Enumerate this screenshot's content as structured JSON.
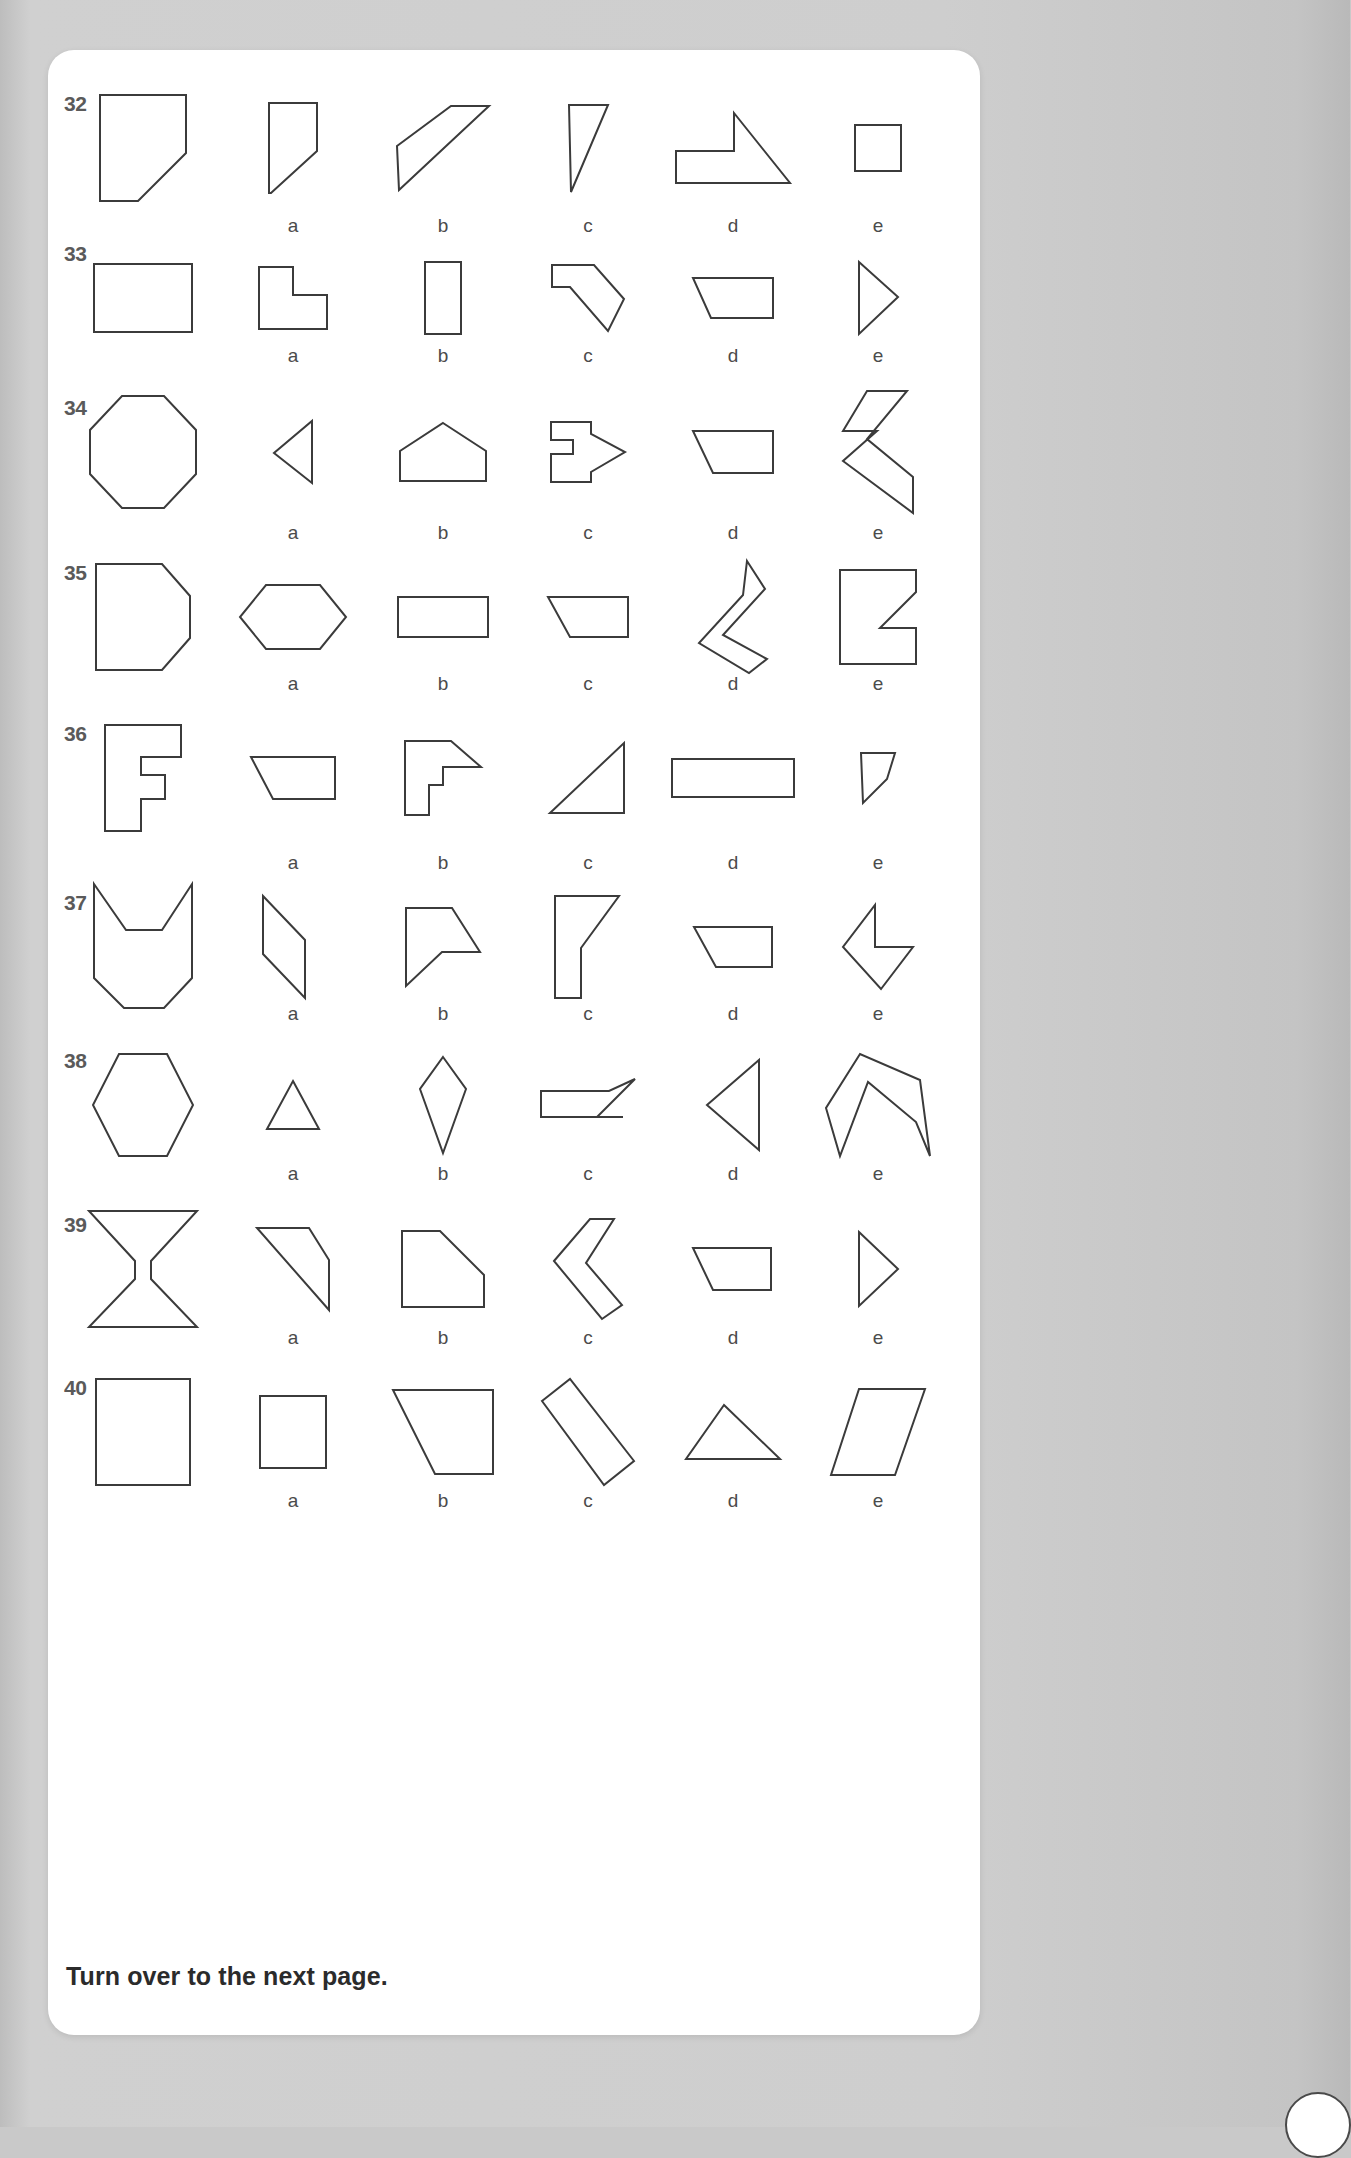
{
  "page": {
    "footer_note": "Turn over to the next page.",
    "background_color": "#c9c9c9",
    "sheet_color": "#ffffff",
    "stroke_color": "#3b3b3b",
    "number_color": "#5a5a5a",
    "label_color": "#4b4b4b"
  },
  "option_labels": [
    "a",
    "b",
    "c",
    "d",
    "e"
  ],
  "rows": [
    {
      "number": "32",
      "target": {
        "name": "rectangle-with-cut-bottom-right-corner",
        "viewbox": "0 0 90 110",
        "points": "2,2 88,2 88,60 40,108 2,108"
      },
      "options": [
        {
          "label": "a",
          "name": "small-rectangle-with-cut-corner",
          "viewbox": "0 0 52 94",
          "points": "2,2 50,2 50,50 4,92 2,92 2,2"
        },
        {
          "label": "b",
          "name": "wide-diagonal-parallelogram",
          "viewbox": "0 0 96 88",
          "points": "2,42 56,2 94,2 4,86"
        },
        {
          "label": "c",
          "name": "narrow-right-triangle",
          "viewbox": "0 0 44 92",
          "points": "3,3 42,3 5,90"
        },
        {
          "label": "d",
          "name": "notched-arrow-polygon",
          "viewbox": "0 0 118 74",
          "points": "2,40 2,72 116,72 60,2 60,40"
        },
        {
          "label": "e",
          "name": "small-square",
          "viewbox": "0 0 50 50",
          "points": "2,2 48,2 48,48 2,48"
        }
      ]
    },
    {
      "number": "33",
      "target": {
        "name": "wide-rectangle",
        "viewbox": "0 0 102 72",
        "points": "2,2 100,2 100,70 2,70"
      },
      "options": [
        {
          "label": "a",
          "name": "l-shape-with-bevel",
          "viewbox": "0 0 72 66",
          "points": "2,2 2,64 70,64 70,30 36,30 36,2"
        },
        {
          "label": "b",
          "name": "tall-narrow-rectangle",
          "viewbox": "0 0 40 76",
          "points": "2,2 38,2 38,74 2,74"
        },
        {
          "label": "c",
          "name": "hook-shape-with-diagonal",
          "viewbox": "0 0 76 70",
          "points": "2,2 44,2 74,36 58,68 20,24 2,24"
        },
        {
          "label": "d",
          "name": "trapezoid-flat-top",
          "viewbox": "0 0 84 44",
          "points": "2,2 82,2 82,42 20,42"
        },
        {
          "label": "e",
          "name": "right-pointing-triangle",
          "viewbox": "0 0 44 78",
          "points": "3,3 42,38 3,75"
        }
      ]
    },
    {
      "number": "34",
      "target": {
        "name": "regular-octagon",
        "viewbox": "0 0 110 116",
        "points": "34,2 76,2 108,36 108,80 76,114 34,114 2,80 2,36"
      },
      "options": [
        {
          "label": "a",
          "name": "left-pointing-triangle",
          "viewbox": "0 0 42 66",
          "points": "40,2 40,64 2,34"
        },
        {
          "label": "b",
          "name": "house-pentagon",
          "viewbox": "0 0 90 62",
          "points": "45,2 88,30 88,60 2,60 2,30"
        },
        {
          "label": "c",
          "name": "arrow-block-right",
          "viewbox": "0 0 78 64",
          "points": "2,2 42,2 42,14 76,32 42,52 42,62 2,62 2,34 24,34 24,20 2,20"
        },
        {
          "label": "d",
          "name": "trapezoid-angled-left",
          "viewbox": "0 0 84 46",
          "points": "2,2 82,2 82,44 22,44"
        },
        {
          "label": "e",
          "name": "thick-angled-band",
          "viewbox": "0 0 74 126",
          "points": "26,2 66,2 26,50 72,88 72,124 2,72 36,42 2,42"
        }
      ]
    },
    {
      "number": "35",
      "target": {
        "name": "rectangle-with-two-cut-corners",
        "viewbox": "0 0 98 110",
        "points": "2,2 68,2 96,34 96,76 68,108 2,108"
      },
      "options": [
        {
          "label": "a",
          "name": "elongated-hexagon",
          "viewbox": "0 0 110 68",
          "points": "28,2 82,2 108,34 82,66 28,66 2,34"
        },
        {
          "label": "b",
          "name": "small-wide-rectangle",
          "viewbox": "0 0 94 44",
          "points": "2,2 92,2 92,42 2,42"
        },
        {
          "label": "c",
          "name": "trapezoid-right-angle",
          "viewbox": "0 0 84 44",
          "points": "2,2 82,2 82,42 24,42"
        },
        {
          "label": "d",
          "name": "chevron-curve-shape",
          "viewbox": "0 0 72 116",
          "points": "50,2 68,30 26,76 70,100 52,114 2,84 46,36"
        },
        {
          "label": "e",
          "name": "flag-notch-shape",
          "viewbox": "0 0 80 98",
          "points": "2,2 78,2 78,24 42,60 78,60 78,96 2,96 2,2"
        }
      ]
    },
    {
      "number": "36",
      "target": {
        "name": "c-shaped-block",
        "viewbox": "0 0 80 110",
        "points": "2,2 78,2 78,34 38,34 38,52 62,52 62,76 38,76 38,108 2,108"
      },
      "options": [
        {
          "label": "a",
          "name": "trapezoid-slanted-left",
          "viewbox": "0 0 88 46",
          "points": "2,2 86,2 86,44 24,44"
        },
        {
          "label": "b",
          "name": "hook-block-shape",
          "viewbox": "0 0 80 78",
          "points": "2,2 48,2 78,28 40,28 40,46 26,46 26,76 2,76"
        },
        {
          "label": "c",
          "name": "right-triangle-pointing-up",
          "viewbox": "0 0 80 74",
          "points": "76,2 76,72 2,72"
        },
        {
          "label": "d",
          "name": "long-flat-rectangle",
          "viewbox": "0 0 126 42",
          "points": "2,2 124,2 124,40 2,40"
        },
        {
          "label": "e",
          "name": "small-slanted-quad",
          "viewbox": "0 0 38 54",
          "points": "2,2 36,2 28,28 4,52 2,2"
        }
      ]
    },
    {
      "number": "37",
      "target": {
        "name": "cat-head-notched-polygon",
        "viewbox": "0 0 102 130",
        "points": "2,2 34,48 70,48 100,2 100,96 72,126 32,126 2,96"
      },
      "options": [
        {
          "label": "a",
          "name": "slanted-parallelogram",
          "viewbox": "0 0 64 106",
          "points": "2,2 44,46 44,104 2,60"
        },
        {
          "label": "b",
          "name": "arrow-flag-shape",
          "viewbox": "0 0 78 82",
          "points": "2,2 48,2 76,46 38,46 2,80"
        },
        {
          "label": "c",
          "name": "boot-shape-polygon",
          "viewbox": "0 0 70 106",
          "points": "2,2 66,2 28,54 28,104 2,104"
        },
        {
          "label": "d",
          "name": "trapezoid-sloped-left",
          "viewbox": "0 0 82 44",
          "points": "2,2 80,2 80,42 24,42"
        },
        {
          "label": "e",
          "name": "arrow-chevron-left",
          "viewbox": "0 0 74 88",
          "points": "34,2 34,44 72,44 40,86 2,44"
        }
      ]
    },
    {
      "number": "38",
      "target": {
        "name": "regular-hexagon",
        "viewbox": "0 0 104 106",
        "points": "28,2 76,2 102,53 76,104 28,104 2,53"
      },
      "options": [
        {
          "label": "a",
          "name": "small-triangle",
          "viewbox": "0 0 56 52",
          "points": "28,2 54,50 2,50"
        },
        {
          "label": "b",
          "name": "narrow-kite-diamond",
          "viewbox": "0 0 50 100",
          "points": "25,2 48,34 25,98 2,34"
        },
        {
          "label": "c",
          "name": "boat-shape-polygon",
          "viewbox": "0 0 98 56",
          "points": "2,14 70,14 96,2 58,40 84,40 2,40 2,14"
        },
        {
          "label": "d",
          "name": "left-pointing-triangle-large",
          "viewbox": "0 0 56 94",
          "points": "54,2 54,92 2,47"
        },
        {
          "label": "e",
          "name": "bent-band-polygon",
          "viewbox": "0 0 108 106",
          "points": "36,2 2,56 16,104 44,30 92,70 106,104 96,28"
        }
      ]
    },
    {
      "number": "39",
      "target": {
        "name": "hourglass-i-beam-shape",
        "viewbox": "0 0 112 120",
        "points": "2,2 110,2 64,52 64,70 110,118 2,118 48,70 48,52"
      },
      "options": [
        {
          "label": "a",
          "name": "triangle-with-notch",
          "viewbox": "0 0 76 86",
          "points": "2,2 54,2 74,34 74,84 2,2"
        },
        {
          "label": "b",
          "name": "step-shape-polygon",
          "viewbox": "0 0 86 80",
          "points": "2,2 40,2 84,46 84,78 2,78"
        },
        {
          "label": "c",
          "name": "bent-thick-strip",
          "viewbox": "0 0 72 104",
          "points": "2,44 38,2 62,2 34,46 70,88 50,102 2,44"
        },
        {
          "label": "d",
          "name": "trapezoid-slope-right",
          "viewbox": "0 0 84 46",
          "points": "2,2 80,2 80,44 22,44"
        },
        {
          "label": "e",
          "name": "right-triangle-pointer",
          "viewbox": "0 0 44 80",
          "points": "3,3 42,40 3,77"
        }
      ]
    },
    {
      "number": "40",
      "target": {
        "name": "large-square",
        "viewbox": "0 0 98 110",
        "points": "2,2 96,2 96,108 2,108"
      },
      "options": [
        {
          "label": "a",
          "name": "medium-square",
          "viewbox": "0 0 70 76",
          "points": "2,2 68,2 68,74 2,74"
        },
        {
          "label": "b",
          "name": "right-triangle-with-flat-top",
          "viewbox": "0 0 104 88",
          "points": "2,2 102,2 102,86 44,86"
        },
        {
          "label": "c",
          "name": "diagonal-thick-bar",
          "viewbox": "0 0 96 110",
          "points": "2,24 30,2 94,84 64,108"
        },
        {
          "label": "d",
          "name": "wide-triangle",
          "viewbox": "0 0 98 58",
          "points": "40,2 96,56 2,56"
        },
        {
          "label": "e",
          "name": "slanted-parallelogram-wide",
          "viewbox": "0 0 98 90",
          "points": "30,2 96,2 66,88 2,88"
        }
      ]
    }
  ]
}
